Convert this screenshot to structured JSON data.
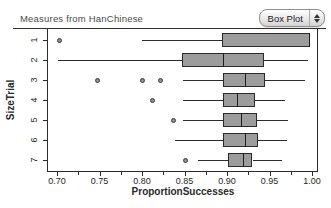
{
  "header": {
    "title": "Measures from HanChinese",
    "plot_type_selector": {
      "label": "Box Plot",
      "icon": "up-down-stepper"
    }
  },
  "colors": {
    "box_fill": "#9c9c9c",
    "box_border": "#2b2b2b",
    "whisker": "#2b2b2b",
    "outlier_fill": "#909090",
    "axis": "#2b2b2b",
    "title_text": "#4a4a4a",
    "background": "#ffffff"
  },
  "chart_data": {
    "type": "boxplot",
    "orientation": "horizontal",
    "title": "Measures from HanChinese",
    "xlabel": "ProportionSuccesses",
    "ylabel": "SizeTrial",
    "categories": [
      "1",
      "2",
      "3",
      "4",
      "5",
      "6",
      "7"
    ],
    "x_ticks": [
      0.7,
      0.75,
      0.8,
      0.85,
      0.9,
      0.95,
      1.0
    ],
    "x_tick_labels": [
      "0.70",
      "0.75",
      "0.80",
      "0.85",
      "0.90",
      "0.95",
      "1.00"
    ],
    "x_minor_ticks": [
      0.725,
      0.775,
      0.825,
      0.875,
      0.925,
      0.975
    ],
    "xlim": [
      0.688,
      1.007
    ],
    "grid": false,
    "legend": null,
    "series": [
      {
        "category": "1",
        "whisker_low": 0.8,
        "q1": 0.894,
        "median": 0.998,
        "q3": 0.998,
        "whisker_high": 0.998,
        "outliers": [
          0.703
        ]
      },
      {
        "category": "2",
        "whisker_low": 0.701,
        "q1": 0.847,
        "median": 0.895,
        "q3": 0.943,
        "whisker_high": 0.995,
        "outliers": []
      },
      {
        "category": "3",
        "whisker_low": 0.848,
        "q1": 0.895,
        "median": 0.921,
        "q3": 0.945,
        "whisker_high": 0.992,
        "outliers": [
          0.748,
          0.8,
          0.822
        ]
      },
      {
        "category": "4",
        "whisker_low": 0.848,
        "q1": 0.895,
        "median": 0.912,
        "q3": 0.933,
        "whisker_high": 0.968,
        "outliers": [
          0.812
        ]
      },
      {
        "category": "5",
        "whisker_low": 0.848,
        "q1": 0.895,
        "median": 0.917,
        "q3": 0.935,
        "whisker_high": 0.972,
        "outliers": [
          0.837
        ]
      },
      {
        "category": "6",
        "whisker_low": 0.839,
        "q1": 0.895,
        "median": 0.921,
        "q3": 0.937,
        "whisker_high": 0.971,
        "outliers": []
      },
      {
        "category": "7",
        "whisker_low": 0.866,
        "q1": 0.901,
        "median": 0.919,
        "q3": 0.93,
        "whisker_high": 0.965,
        "outliers": [
          0.851
        ]
      }
    ]
  }
}
